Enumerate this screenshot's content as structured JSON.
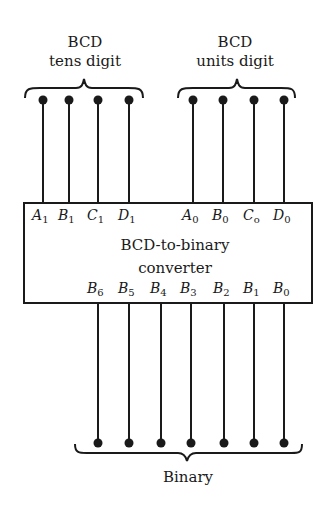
{
  "diagram": {
    "inputs": {
      "tens": {
        "title_line1": "BCD",
        "title_line2": "tens digit",
        "pins": [
          {
            "name": "A",
            "sub": "1",
            "x": 43
          },
          {
            "name": "B",
            "sub": "1",
            "x": 69
          },
          {
            "name": "C",
            "sub": "1",
            "x": 98
          },
          {
            "name": "D",
            "sub": "1",
            "x": 129
          }
        ]
      },
      "units": {
        "title_line1": "BCD",
        "title_line2": "units digit",
        "pins": [
          {
            "name": "A",
            "sub": "0",
            "x": 193
          },
          {
            "name": "B",
            "sub": "0",
            "x": 223
          },
          {
            "name": "C",
            "sub": "o",
            "x": 254
          },
          {
            "name": "D",
            "sub": "0",
            "x": 284
          }
        ]
      }
    },
    "block": {
      "line1": "BCD-to-binary",
      "line2": "converter"
    },
    "outputs": {
      "title": "Binary",
      "pins": [
        {
          "name": "B",
          "sub": "6",
          "x": 98
        },
        {
          "name": "B",
          "sub": "5",
          "x": 129
        },
        {
          "name": "B",
          "sub": "4",
          "x": 161
        },
        {
          "name": "B",
          "sub": "3",
          "x": 191
        },
        {
          "name": "B",
          "sub": "2",
          "x": 224
        },
        {
          "name": "B",
          "sub": "1",
          "x": 254
        },
        {
          "name": "B",
          "sub": "0",
          "x": 284
        }
      ]
    },
    "colors": {
      "ink": "#1a1a1a",
      "background": "#ffffff"
    }
  }
}
